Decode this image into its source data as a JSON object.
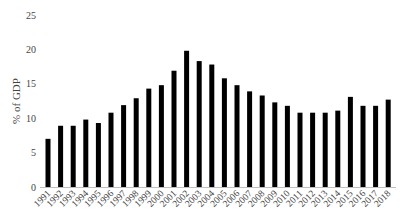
{
  "chart_data": {
    "type": "bar",
    "title": "",
    "xlabel": "",
    "ylabel": "% of GDP",
    "ylim": [
      0,
      25
    ],
    "yticks": [
      0,
      5,
      10,
      15,
      20,
      25
    ],
    "grid": false,
    "legend": null,
    "bar_color": "#000000",
    "categories": [
      "1991",
      "1992",
      "1993",
      "1994",
      "1995",
      "1996",
      "1997",
      "1998",
      "1999",
      "2000",
      "2001",
      "2002",
      "2003",
      "2004",
      "2005",
      "2006",
      "2007",
      "2008",
      "2009",
      "2010",
      "2011",
      "2012",
      "2013",
      "2014",
      "2015",
      "2016",
      "2017",
      "2018"
    ],
    "values": [
      7.0,
      8.9,
      8.9,
      9.8,
      9.3,
      10.8,
      11.9,
      12.9,
      14.3,
      14.8,
      16.9,
      19.8,
      18.3,
      17.8,
      15.8,
      14.8,
      13.9,
      13.3,
      12.3,
      11.8,
      10.8,
      10.8,
      10.8,
      11.1,
      13.1,
      11.8,
      11.8,
      12.7
    ]
  }
}
